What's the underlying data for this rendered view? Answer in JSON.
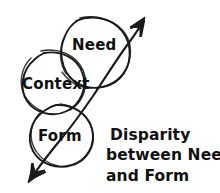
{
  "diagram": {
    "title_present": false,
    "background_color": "#ffffff",
    "ink_color": "#1a1a1a",
    "style": "hand-drawn sketch",
    "circles": [
      {
        "id": "need",
        "label": "Need",
        "cx": 93,
        "cy": 52,
        "r": 36
      },
      {
        "id": "context",
        "label": "Context",
        "cx": 52,
        "cy": 84,
        "r": 33
      },
      {
        "id": "form",
        "label": "Form",
        "cx": 62,
        "cy": 135,
        "r": 31
      }
    ],
    "arrow": {
      "name": "disparity-axis-arrow",
      "description": "double-headed diagonal arrow",
      "head_upper_right": "up-right",
      "head_lower_left": "down-left",
      "start_x": 30,
      "start_y": 178,
      "end_x": 150,
      "end_y": 15
    },
    "caption": {
      "lines": [
        "Disparity",
        "between Need",
        "and Form"
      ],
      "full_text": "Disparity between Need and Form",
      "x": 108,
      "y": 140
    }
  }
}
